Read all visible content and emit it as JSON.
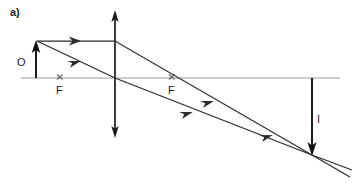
{
  "figure": {
    "panel_label": "a)",
    "background_color": "#ffffff",
    "width": 355,
    "height": 183,
    "type": "converging-lens-ray-diagram"
  },
  "colors": {
    "axis": "#9a9a9a",
    "ray": "#2b2b2b",
    "lens": "#1a1a1a",
    "object_arrow": "#111111",
    "image_arrow": "#111111",
    "text": "#1a1a1a",
    "focal_mark": "#6a6a6a"
  },
  "axis": {
    "name": "principal-axis",
    "x1": 21,
    "y1": 78,
    "x2": 340,
    "y2": 78,
    "stroke_width": 1.2
  },
  "lens": {
    "name": "converging-lens",
    "x": 115,
    "y_top": 11,
    "y_bottom": 137,
    "stroke_width": 1.6,
    "double_headed": true
  },
  "object": {
    "label": "O",
    "label_x": 17,
    "label_y": 66,
    "x": 36,
    "y_base": 78,
    "y_tip": 41,
    "direction": "up"
  },
  "image": {
    "label": "I",
    "label_x": 317,
    "label_y": 123,
    "x": 312,
    "y_base": 78,
    "y_tip": 155,
    "direction": "down"
  },
  "focal_points": [
    {
      "label": "F",
      "side": "object-side",
      "mark_x": 60,
      "mark_y": 77,
      "label_x": 57,
      "label_y": 93
    },
    {
      "label": "F",
      "side": "image-side",
      "mark_x": 172,
      "mark_y": 77,
      "label_x": 169,
      "label_y": 93
    }
  ],
  "rays": [
    {
      "name": "parallel-ray",
      "description": "parallel to axis then refracted through image-side focal point",
      "points": [
        [
          37,
          41
        ],
        [
          115,
          41
        ],
        [
          312,
          155
        ],
        [
          350,
          177
        ]
      ],
      "arrowheads": [
        {
          "x": 76,
          "y": 41,
          "angle": 0
        },
        {
          "x": 209,
          "y": 99,
          "angle": 30
        },
        {
          "x": 268,
          "y": 133,
          "angle": 30
        }
      ]
    },
    {
      "name": "chief-ray",
      "description": "through optical centre of lens, undeviated",
      "points": [
        [
          37,
          41
        ],
        [
          115,
          78
        ],
        [
          312,
          155
        ],
        [
          352,
          170
        ]
      ],
      "arrowheads": [
        {
          "x": 76,
          "y": 59,
          "angle": 25
        },
        {
          "x": 188,
          "y": 110,
          "angle": 21
        }
      ]
    }
  ],
  "chart_data": {
    "type": "diagram",
    "title": "a)",
    "elements": [
      "principal axis",
      "converging lens (double arrow)",
      "object arrow O",
      "image arrow I",
      "focal point F (left)",
      "focal point F (right)",
      "parallel incident ray refracted through F",
      "chief ray through lens centre"
    ]
  }
}
